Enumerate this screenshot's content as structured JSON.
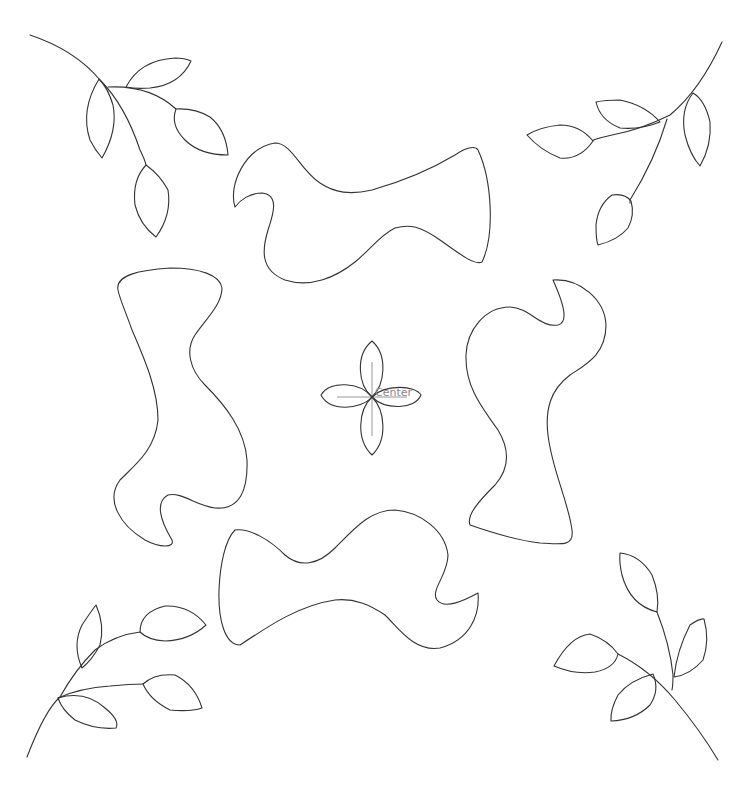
{
  "diagram": {
    "type": "quilting-pattern-line-art",
    "background": "#ffffff",
    "stroke_color": "#333333",
    "center_marker": {
      "label": "Center",
      "label_color": "#8a8a8a"
    },
    "elements": [
      {
        "name": "leaf-branch-top-left",
        "kind": "branch",
        "leaves": 5
      },
      {
        "name": "leaf-branch-top-right",
        "kind": "branch",
        "leaves": 5
      },
      {
        "name": "leaf-branch-bottom-left",
        "kind": "branch",
        "leaves": 4
      },
      {
        "name": "leaf-branch-bottom-right",
        "kind": "branch",
        "leaves": 4
      },
      {
        "name": "wavy-shape-top",
        "kind": "applique-shape"
      },
      {
        "name": "wavy-shape-left",
        "kind": "applique-shape"
      },
      {
        "name": "wavy-shape-right",
        "kind": "applique-shape"
      },
      {
        "name": "wavy-shape-bottom",
        "kind": "applique-shape"
      },
      {
        "name": "center-flower",
        "kind": "four-petal-flower"
      }
    ]
  }
}
